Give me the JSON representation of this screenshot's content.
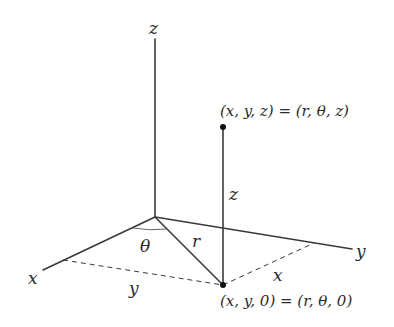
{
  "diagram": {
    "axes": {
      "x_label": "x",
      "y_label": "y",
      "z_label": "z"
    },
    "segments": {
      "r_label": "r",
      "z_label": "z",
      "theta_label": "θ",
      "dashed_x_label": "x",
      "dashed_y_label": "y"
    },
    "points": {
      "top_label": "(x, y, z) = (r, θ, z)",
      "bottom_label": "(x, y, 0) = (r, θ, 0)"
    },
    "colors": {
      "line": "#3a3a3a",
      "point": "#111111",
      "text": "#2b2b2b",
      "background": "#ffffff"
    }
  }
}
